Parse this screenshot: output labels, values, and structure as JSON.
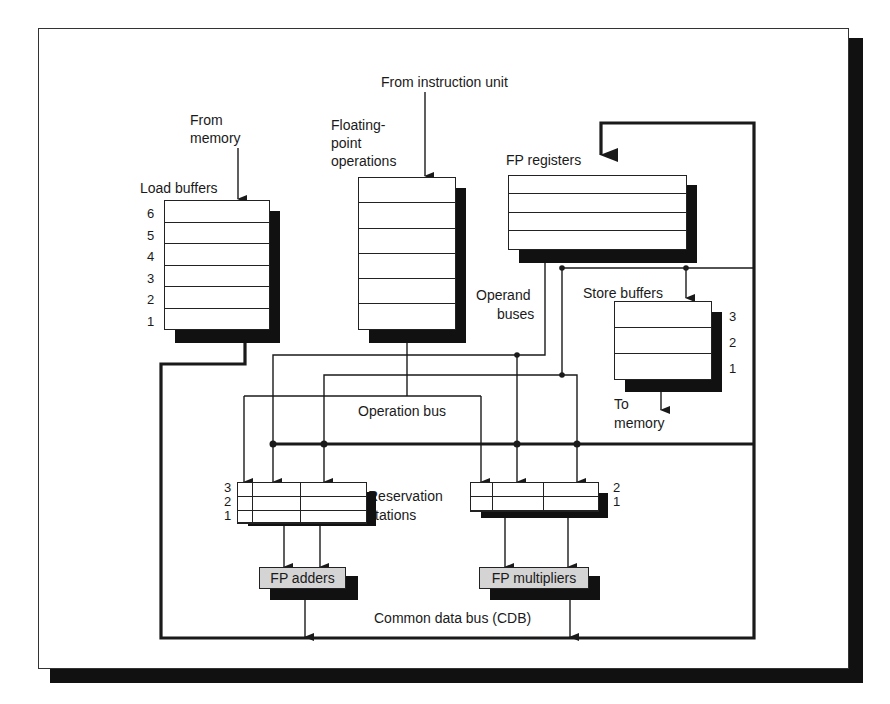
{
  "diagram": {
    "title_labels": {
      "from_instruction_unit": "From instruction unit",
      "from_memory_line1": "From",
      "from_memory_line2": "memory",
      "fp_ops_line1": "Floating-",
      "fp_ops_line2": "point",
      "fp_ops_line3": "operations",
      "load_buffers": "Load buffers",
      "fp_registers": "FP registers",
      "operand_buses_line1": "Operand",
      "operand_buses_line2": "buses",
      "store_buffers": "Store buffers",
      "to_memory_line1": "To",
      "to_memory_line2": "memory",
      "operation_bus": "Operation bus",
      "reservation_stations_line1": "Reservation",
      "reservation_stations_line2": "stations",
      "cdb": "Common data bus (CDB)"
    },
    "load_buffers": {
      "entries": [
        "6",
        "5",
        "4",
        "3",
        "2",
        "1"
      ]
    },
    "fp_op_queue": {
      "rows": 6
    },
    "fp_registers": {
      "rows": 4
    },
    "store_buffers": {
      "entries": [
        "3",
        "2",
        "1"
      ]
    },
    "adder_reservation_stations": {
      "entries": [
        "3",
        "2",
        "1"
      ]
    },
    "multiplier_reservation_stations": {
      "entries": [
        "2",
        "1"
      ]
    },
    "functional_units": {
      "adders": "FP adders",
      "multipliers": "FP multipliers"
    },
    "colors": {
      "line": "#1a1a1a",
      "shadow": "#111111",
      "functional_unit_fill": "#d4d4d4",
      "background": "#ffffff"
    }
  }
}
